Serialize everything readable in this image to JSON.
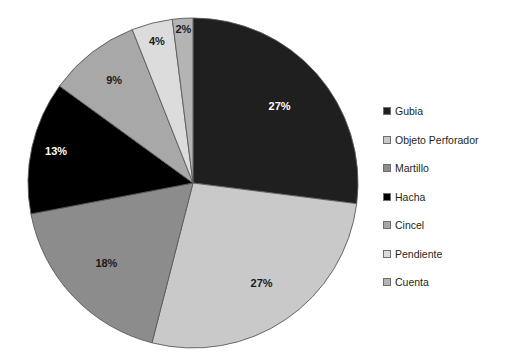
{
  "chart_data": {
    "type": "pie",
    "title": "",
    "categories": [
      "Gubia",
      "Objeto Perforador",
      "Martillo",
      "Hacha",
      "Cincel",
      "Pendiente",
      "Cuenta"
    ],
    "values": [
      27,
      27,
      18,
      13,
      9,
      4,
      2
    ],
    "value_labels": [
      "27%",
      "27%",
      "18%",
      "13%",
      "9%",
      "4%",
      "2%"
    ],
    "unit": "%",
    "start_angle_deg": 0,
    "direction": "clockwise",
    "legend_position": "right",
    "grid": false,
    "colors": [
      "#1f1f1f",
      "#c9c9c9",
      "#8c8c8c",
      "#000000",
      "#a8a8a8",
      "#dcdcdc",
      "#b4b4b4"
    ],
    "label_text_colors": [
      "#ffffff",
      "#1a1a1a",
      "#1a1a1a",
      "#ffffff",
      "#1a1a1a",
      "#1a1a1a",
      "#1a1a1a"
    ],
    "slice_outline_color": "#5a5a5a",
    "background_color": "#ffffff"
  },
  "pie": {
    "center_x": 193,
    "center_y": 183,
    "radius": 165,
    "slices": [
      {
        "name": "Gubia",
        "percent": 27,
        "label": "27%",
        "color": "#1f1f1f",
        "text_color": "#ffffff",
        "label_radius_factor": 0.7
      },
      {
        "name": "Objeto Perforador",
        "percent": 27,
        "label": "27%",
        "color": "#c9c9c9",
        "text_color": "#1a1a1a",
        "label_radius_factor": 0.74
      },
      {
        "name": "Martillo",
        "percent": 18,
        "label": "18%",
        "color": "#8c8c8c",
        "text_color": "#1a1a1a",
        "label_radius_factor": 0.72
      },
      {
        "name": "Hacha",
        "percent": 13,
        "label": "13%",
        "color": "#000000",
        "text_color": "#ffffff",
        "label_radius_factor": 0.85
      },
      {
        "name": "Cincel",
        "percent": 9,
        "label": "9%",
        "color": "#a8a8a8",
        "text_color": "#1a1a1a",
        "label_radius_factor": 0.78
      },
      {
        "name": "Pendiente",
        "percent": 4,
        "label": "4%",
        "color": "#dcdcdc",
        "text_color": "#1a1a1a",
        "label_radius_factor": 0.88
      },
      {
        "name": "Cuenta",
        "percent": 2,
        "label": "2%",
        "color": "#b4b4b4",
        "text_color": "#1a1a1a",
        "label_radius_factor": 0.93
      }
    ]
  },
  "legend": {
    "items": [
      {
        "label": "Gubia",
        "color": "#1f1f1f"
      },
      {
        "label": "Objeto Perforador",
        "color": "#c9c9c9"
      },
      {
        "label": "Martillo",
        "color": "#8c8c8c"
      },
      {
        "label": "Hacha",
        "color": "#000000"
      },
      {
        "label": "Cincel",
        "color": "#a8a8a8"
      },
      {
        "label": "Pendiente",
        "color": "#dcdcdc"
      },
      {
        "label": "Cuenta",
        "color": "#b4b4b4"
      }
    ]
  }
}
